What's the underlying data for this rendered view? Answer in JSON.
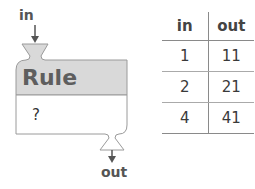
{
  "machine": {
    "input_label": "in",
    "output_label": "out",
    "title": "Rule",
    "rule": "?",
    "colors": {
      "header_fill": "#d9d9d9",
      "body_fill": "#ffffff",
      "stroke": "#9a9a9a",
      "arrow": "#555555"
    }
  },
  "table": {
    "headers": [
      "in",
      "out"
    ],
    "rows": [
      {
        "in": "1",
        "out": "11"
      },
      {
        "in": "2",
        "out": "21"
      },
      {
        "in": "4",
        "out": "41"
      }
    ]
  }
}
